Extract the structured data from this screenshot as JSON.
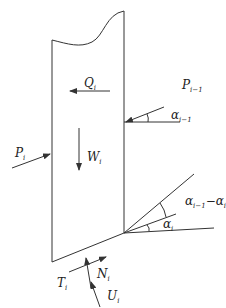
{
  "diagram": {
    "title": "",
    "labels": {
      "Q": {
        "base": "Q",
        "sub": "i"
      },
      "W": {
        "base": "W",
        "sub": "i"
      },
      "P_prev": {
        "base": "P",
        "sub": "i−1"
      },
      "P": {
        "base": "P",
        "sub": "i"
      },
      "alpha_prev": {
        "base": "α",
        "sub": "i−1"
      },
      "alpha_diff": {
        "base": "α",
        "sub": "i−1",
        "suffix": "−α",
        "suffix_sub": "i"
      },
      "alpha": {
        "base": "α",
        "sub": "i"
      },
      "T": {
        "base": "T",
        "sub": "i"
      },
      "N": {
        "base": "N",
        "sub": "i"
      },
      "U": {
        "base": "U",
        "sub": "i"
      }
    },
    "colors": {
      "stroke": "#333333",
      "text": "#222222",
      "background": "#ffffff"
    }
  }
}
